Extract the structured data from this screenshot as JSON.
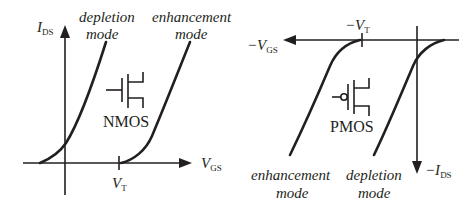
{
  "nmos": {
    "y_axis_label": "I",
    "y_axis_sub": "DS",
    "x_axis_label": "V",
    "x_axis_sub": "GS",
    "threshold_label": "V",
    "threshold_sub": "T",
    "device_label": "NMOS",
    "curves": [
      {
        "line1": "depletion",
        "line2": "mode"
      },
      {
        "line1": "enhancement",
        "line2": "mode"
      }
    ]
  },
  "pmos": {
    "y_axis_label": "−I",
    "y_axis_sub": "DS",
    "x_axis_label": "−V",
    "x_axis_sub": "GS",
    "threshold_label": "−V",
    "threshold_sub": "T",
    "device_label": "PMOS",
    "curves": [
      {
        "line1": "enhancement",
        "line2": "mode"
      },
      {
        "line1": "depletion",
        "line2": "mode"
      }
    ]
  },
  "colors": {
    "ink": "#231f20",
    "background": "#ffffff"
  }
}
